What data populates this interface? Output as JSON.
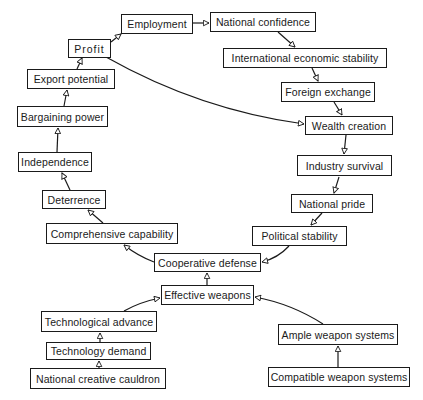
{
  "diagram": {
    "type": "causal-flow",
    "colors": {
      "stroke": "#1a1a1a",
      "background": "#ffffff"
    },
    "nodes": [
      {
        "id": "employment",
        "label": "Employment",
        "x": 121,
        "y": 14,
        "w": 72,
        "h": 20
      },
      {
        "id": "national_confidence",
        "label": "National confidence",
        "x": 210,
        "y": 12,
        "w": 106,
        "h": 20
      },
      {
        "id": "profit",
        "label": "Profit",
        "x": 68,
        "y": 39,
        "w": 43,
        "h": 19
      },
      {
        "id": "intl_econ_stability",
        "label": "International economic stability",
        "x": 223,
        "y": 48,
        "w": 164,
        "h": 20
      },
      {
        "id": "export_potential",
        "label": "Export potential",
        "x": 27,
        "y": 69,
        "w": 88,
        "h": 20
      },
      {
        "id": "foreign_exchange",
        "label": "Foreign exchange",
        "x": 281,
        "y": 82,
        "w": 94,
        "h": 20
      },
      {
        "id": "bargaining_power",
        "label": "Bargaining power",
        "x": 17,
        "y": 106,
        "w": 91,
        "h": 21
      },
      {
        "id": "wealth_creation",
        "label": "Wealth creation",
        "x": 305,
        "y": 116,
        "w": 88,
        "h": 19
      },
      {
        "id": "independence",
        "label": "Independence",
        "x": 18,
        "y": 152,
        "w": 74,
        "h": 20
      },
      {
        "id": "industry_survival",
        "label": "Industry survival",
        "x": 297,
        "y": 155,
        "w": 95,
        "h": 21
      },
      {
        "id": "deterrence",
        "label": "Deterrence",
        "x": 42,
        "y": 190,
        "w": 64,
        "h": 19
      },
      {
        "id": "national_pride",
        "label": "National pride",
        "x": 291,
        "y": 194,
        "w": 82,
        "h": 19
      },
      {
        "id": "comprehensive_capability",
        "label": "Comprehensive capability",
        "x": 46,
        "y": 223,
        "w": 132,
        "h": 21
      },
      {
        "id": "political_stability",
        "label": "Political stability",
        "x": 252,
        "y": 226,
        "w": 95,
        "h": 20
      },
      {
        "id": "cooperative_defense",
        "label": "Cooperative defense",
        "x": 154,
        "y": 253,
        "w": 107,
        "h": 19
      },
      {
        "id": "effective_weapons",
        "label": "Effective weapons",
        "x": 161,
        "y": 285,
        "w": 93,
        "h": 20
      },
      {
        "id": "technological_advance",
        "label": "Technological advance",
        "x": 41,
        "y": 311,
        "w": 116,
        "h": 21
      },
      {
        "id": "ample_weapon_systems",
        "label": "Ample weapon systems",
        "x": 278,
        "y": 324,
        "w": 120,
        "h": 21
      },
      {
        "id": "technology_demand",
        "label": "Technology demand",
        "x": 46,
        "y": 342,
        "w": 105,
        "h": 18
      },
      {
        "id": "national_creative_cauldron",
        "label": "National creative cauldron",
        "x": 30,
        "y": 368,
        "w": 136,
        "h": 21
      },
      {
        "id": "compatible_weapon_systems",
        "label": "Compatible weapon systems",
        "x": 268,
        "y": 367,
        "w": 142,
        "h": 20
      }
    ],
    "edges": [
      {
        "from": "national_creative_cauldron",
        "to": "technology_demand"
      },
      {
        "from": "technology_demand",
        "to": "technological_advance"
      },
      {
        "from": "technological_advance",
        "to": "effective_weapons"
      },
      {
        "from": "compatible_weapon_systems",
        "to": "ample_weapon_systems"
      },
      {
        "from": "ample_weapon_systems",
        "to": "effective_weapons"
      },
      {
        "from": "effective_weapons",
        "to": "cooperative_defense"
      },
      {
        "from": "cooperative_defense",
        "to": "comprehensive_capability"
      },
      {
        "from": "political_stability",
        "to": "cooperative_defense"
      },
      {
        "from": "comprehensive_capability",
        "to": "deterrence"
      },
      {
        "from": "deterrence",
        "to": "independence"
      },
      {
        "from": "independence",
        "to": "bargaining_power"
      },
      {
        "from": "bargaining_power",
        "to": "export_potential"
      },
      {
        "from": "export_potential",
        "to": "profit"
      },
      {
        "from": "profit",
        "to": "employment"
      },
      {
        "from": "profit",
        "to": "wealth_creation"
      },
      {
        "from": "employment",
        "to": "national_confidence"
      },
      {
        "from": "national_confidence",
        "to": "intl_econ_stability"
      },
      {
        "from": "intl_econ_stability",
        "to": "foreign_exchange"
      },
      {
        "from": "foreign_exchange",
        "to": "wealth_creation"
      },
      {
        "from": "wealth_creation",
        "to": "industry_survival"
      },
      {
        "from": "industry_survival",
        "to": "national_pride"
      },
      {
        "from": "national_pride",
        "to": "political_stability"
      }
    ]
  }
}
